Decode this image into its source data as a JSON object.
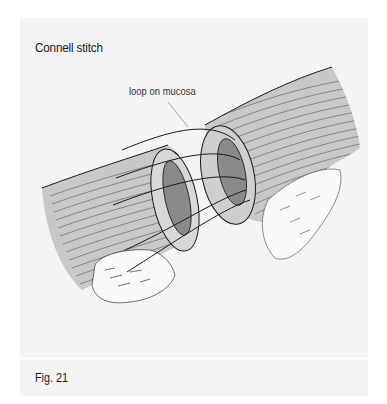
{
  "figure": {
    "title": "Connell stitch",
    "annotation": "loop on mucosa",
    "caption": "Fig. 21"
  },
  "colors": {
    "panel_background": "#f4f4f4",
    "page_background": "#ffffff",
    "bowel_shading": "#c8c8c8",
    "line_ink": "#1a1a1a",
    "leader_line": "#8a8a8a"
  }
}
